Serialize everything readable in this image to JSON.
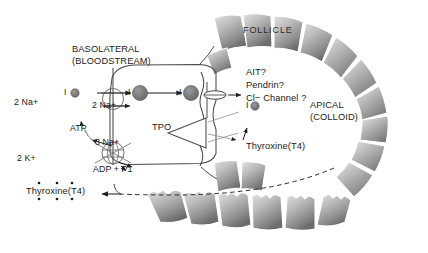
{
  "figure": {
    "title_visible": false,
    "background_color": "#ffffff",
    "text_color": "#1b1b1b",
    "cell_fill_light": "#d8d8d8",
    "cell_fill_mid": "#a6a6a6",
    "cell_fill_dark": "#6f6f6f",
    "molecule_fill": "#777777",
    "stroke_color": "#3a3a3a"
  },
  "compartments": {
    "basolateral_line1": "BASOLATERAL",
    "basolateral_line2": "(BLOODSTREAM)",
    "apical_line1": "APICAL",
    "apical_line2": "(COLLOID)",
    "follicle": "FOLLICLE"
  },
  "labels": {
    "sodium_out": "2 Na+",
    "potassium_in": "2 K+",
    "atp": "ATP",
    "three_sodium": "3 Na+",
    "adp_pi": "ADP + P1",
    "two_sodium_symport": "2 Na+",
    "iodide_extracellular": "I",
    "iodide_apical": "I",
    "tpo": "TPO",
    "apical_transporters_1": "AIT?",
    "apical_transporters_2": "Pendrin?",
    "apical_transporters_3": "Cl− Channel ?",
    "thyroxine_secreted": "Thyroxine(T4)",
    "thyroxine_apical": "Thyroxine(T4)"
  },
  "follicle_cells": {
    "count": 19,
    "description": "ring of gray epithelial cells with scalloped apical borders"
  },
  "molecules": {
    "iodide_circles": 3,
    "circle_radius_px": [
      4.0,
      7.5,
      7.5
    ]
  }
}
